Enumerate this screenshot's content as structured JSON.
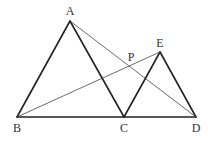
{
  "diagram": {
    "type": "geometry-figure",
    "colors": {
      "stroke": "#222222",
      "thin_stroke": "#444444",
      "label": "#333333",
      "background": "#ffffff"
    },
    "points": {
      "A": {
        "label": "A",
        "x": 70,
        "y": 21,
        "lx": 70,
        "ly": 15
      },
      "B": {
        "label": "B",
        "x": 17,
        "y": 117,
        "lx": 17,
        "ly": 132
      },
      "C": {
        "label": "C",
        "x": 124,
        "y": 117,
        "lx": 124,
        "ly": 132
      },
      "D": {
        "label": "D",
        "x": 196,
        "y": 117,
        "lx": 196,
        "ly": 132
      },
      "E": {
        "label": "E",
        "x": 160,
        "y": 52,
        "lx": 160,
        "ly": 47
      },
      "P": {
        "label": "P",
        "x": 130,
        "y": 66,
        "lx": 131,
        "ly": 61
      }
    },
    "segments": [
      {
        "from": "A",
        "to": "B",
        "weight": "thick"
      },
      {
        "from": "A",
        "to": "C",
        "weight": "thick"
      },
      {
        "from": "B",
        "to": "D",
        "weight": "thick"
      },
      {
        "from": "C",
        "to": "E",
        "weight": "thick"
      },
      {
        "from": "E",
        "to": "D",
        "weight": "thick"
      },
      {
        "from": "A",
        "to": "D",
        "weight": "thin"
      },
      {
        "from": "B",
        "to": "E",
        "weight": "thin"
      }
    ]
  }
}
